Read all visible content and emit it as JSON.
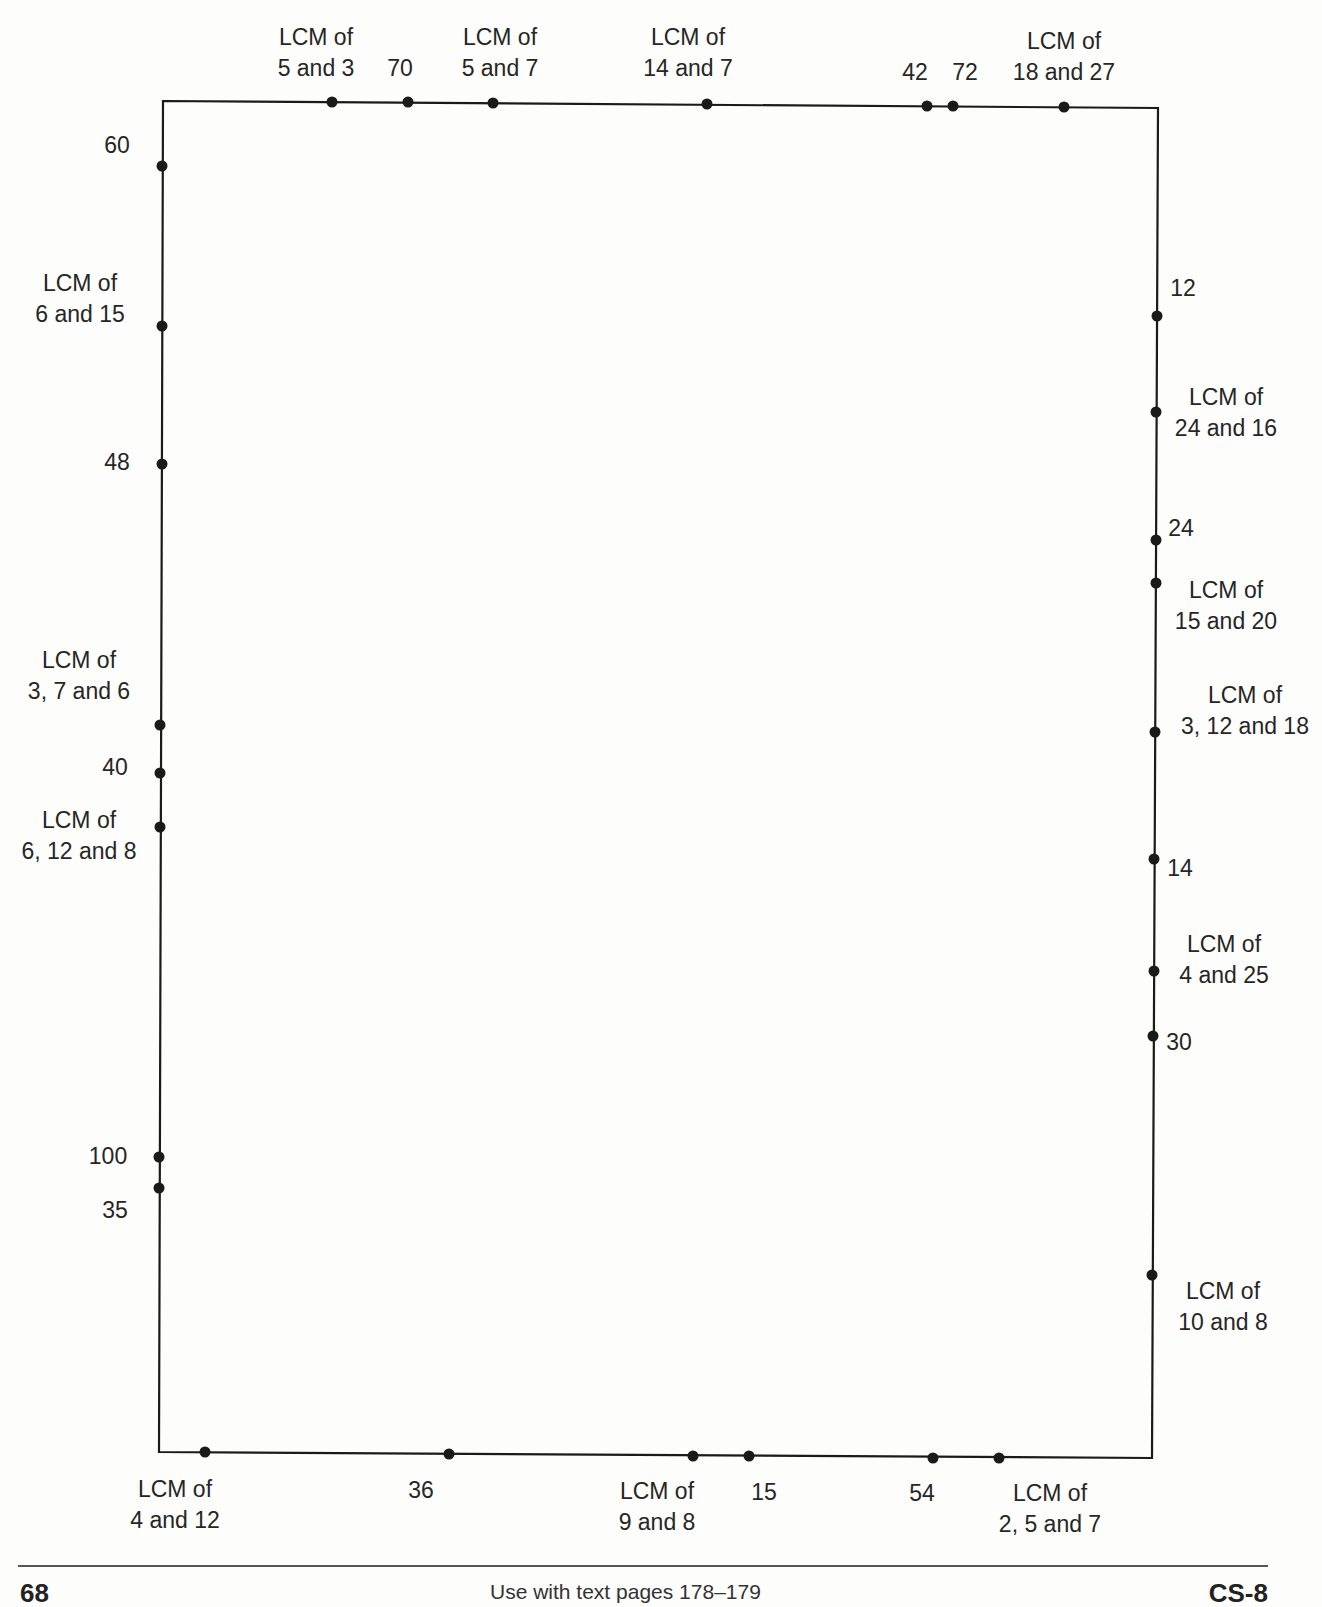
{
  "diagram": {
    "frame": {
      "left": 162,
      "top": 101,
      "right": 1138,
      "bottom": 1432,
      "stroke": "#1a1a1a"
    },
    "top_points": [
      {
        "label": [
          "LCM of",
          "5 and 3"
        ],
        "x": 332,
        "y": 102,
        "label_x": 316,
        "label_y": 22
      },
      {
        "label": [
          "70"
        ],
        "x": 408,
        "y": 102,
        "label_x": 400,
        "label_y": 53
      },
      {
        "label": [
          "LCM of",
          "5 and 7"
        ],
        "x": 493,
        "y": 103,
        "label_x": 500,
        "label_y": 22
      },
      {
        "label": [
          "LCM of",
          "14 and 7"
        ],
        "x": 707,
        "y": 104,
        "label_x": 688,
        "label_y": 22
      },
      {
        "label": [
          "42"
        ],
        "x": 927,
        "y": 106,
        "label_x": 915,
        "label_y": 57
      },
      {
        "label": [
          "72"
        ],
        "x": 953,
        "y": 106,
        "label_x": 965,
        "label_y": 57
      },
      {
        "label": [
          "LCM of",
          "18 and 27"
        ],
        "x": 1064,
        "y": 107,
        "label_x": 1064,
        "label_y": 26
      }
    ],
    "left_points": [
      {
        "label": [
          "60"
        ],
        "x": 162,
        "y": 166,
        "label_x": 117,
        "label_y": 130
      },
      {
        "label": [
          "LCM of",
          "6 and 15"
        ],
        "x": 162,
        "y": 326,
        "label_x": 80,
        "label_y": 268
      },
      {
        "label": [
          "48"
        ],
        "x": 162,
        "y": 464,
        "label_x": 117,
        "label_y": 447
      },
      {
        "label": [
          "LCM of",
          "3, 7 and 6"
        ],
        "x": 160,
        "y": 725,
        "label_x": 79,
        "label_y": 645
      },
      {
        "label": [
          "40"
        ],
        "x": 160,
        "y": 773,
        "label_x": 115,
        "label_y": 752
      },
      {
        "label": [
          "LCM of",
          "6, 12 and 8"
        ],
        "x": 160,
        "y": 827,
        "label_x": 79,
        "label_y": 805
      },
      {
        "label": [
          "100"
        ],
        "x": 159,
        "y": 1157,
        "label_x": 108,
        "label_y": 1141
      },
      {
        "label": [
          "35"
        ],
        "x": 159,
        "y": 1188,
        "label_x": 115,
        "label_y": 1195
      }
    ],
    "right_points": [
      {
        "label": [
          "12"
        ],
        "x": 1157,
        "y": 316,
        "label_x": 1183,
        "label_y": 273
      },
      {
        "label": [
          "LCM of",
          "24 and 16"
        ],
        "x": 1156,
        "y": 412,
        "label_x": 1226,
        "label_y": 382
      },
      {
        "label": [
          "24"
        ],
        "x": 1156,
        "y": 540,
        "label_x": 1181,
        "label_y": 513
      },
      {
        "label": [
          "LCM of",
          "15 and 20"
        ],
        "x": 1156,
        "y": 583,
        "label_x": 1226,
        "label_y": 575
      },
      {
        "label": [
          "LCM of",
          "3, 12 and 18"
        ],
        "x": 1155,
        "y": 732,
        "label_x": 1245,
        "label_y": 680
      },
      {
        "label": [
          "14"
        ],
        "x": 1154,
        "y": 859,
        "label_x": 1180,
        "label_y": 853
      },
      {
        "label": [
          "LCM of",
          "4 and 25"
        ],
        "x": 1154,
        "y": 971,
        "label_x": 1224,
        "label_y": 929
      },
      {
        "label": [
          "30"
        ],
        "x": 1153,
        "y": 1036,
        "label_x": 1179,
        "label_y": 1027
      },
      {
        "label": [
          "LCM of",
          "10 and 8"
        ],
        "x": 1152,
        "y": 1275,
        "label_x": 1223,
        "label_y": 1276
      }
    ],
    "bottom_points": [
      {
        "label": [
          "LCM of",
          "4 and 12"
        ],
        "x": 205,
        "y": 1452,
        "label_x": 175,
        "label_y": 1474
      },
      {
        "label": [
          "36"
        ],
        "x": 449,
        "y": 1454,
        "label_x": 421,
        "label_y": 1475
      },
      {
        "label": [
          "LCM of",
          "9 and 8"
        ],
        "x": 693,
        "y": 1456,
        "label_x": 657,
        "label_y": 1476
      },
      {
        "label": [
          "15"
        ],
        "x": 749,
        "y": 1456,
        "label_x": 764,
        "label_y": 1477
      },
      {
        "label": [
          "54"
        ],
        "x": 933,
        "y": 1458,
        "label_x": 922,
        "label_y": 1478
      },
      {
        "label": [
          "LCM of",
          "2, 5 and 7"
        ],
        "x": 999,
        "y": 1458,
        "label_x": 1050,
        "label_y": 1478
      }
    ]
  },
  "footer": {
    "page_number": "68",
    "note": "Use with text pages 178–179",
    "code": "CS-8"
  }
}
